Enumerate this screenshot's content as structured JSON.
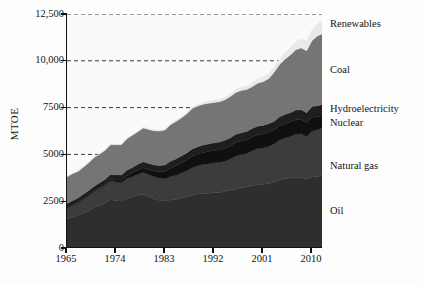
{
  "chart_data": {
    "type": "area",
    "stacked": true,
    "title": "",
    "subtitle": "",
    "xlabel": "",
    "ylabel": "MTOE",
    "xlim": [
      1965,
      2012
    ],
    "ylim": [
      0,
      12500
    ],
    "grid": true,
    "grid_style": "dashed-horizontal",
    "legend_position": "right-outside-series-labels",
    "ytick_labels": [
      "12,500",
      "10,000",
      "7500",
      "5000",
      "2500",
      "0"
    ],
    "ytick_values": [
      12500,
      10000,
      7500,
      5000,
      2500,
      0
    ],
    "xtick_labels": [
      "1965",
      "1974",
      "1983",
      "1992",
      "2001",
      "2010"
    ],
    "xtick_values": [
      1965,
      1974,
      1983,
      1992,
      2001,
      2010
    ],
    "x": [
      1965,
      1966,
      1967,
      1968,
      1969,
      1970,
      1971,
      1972,
      1973,
      1974,
      1975,
      1976,
      1977,
      1978,
      1979,
      1980,
      1981,
      1982,
      1983,
      1984,
      1985,
      1986,
      1987,
      1988,
      1989,
      1990,
      1991,
      1992,
      1993,
      1994,
      1995,
      1996,
      1997,
      1998,
      1999,
      2000,
      2001,
      2002,
      2003,
      2004,
      2005,
      2006,
      2007,
      2008,
      2009,
      2010,
      2011,
      2012
    ],
    "series": [
      {
        "name": "Oil",
        "color": "#2e2e2e",
        "values": [
          1530,
          1640,
          1740,
          1870,
          2000,
          2160,
          2270,
          2400,
          2580,
          2540,
          2500,
          2660,
          2740,
          2830,
          2870,
          2740,
          2620,
          2540,
          2510,
          2560,
          2580,
          2680,
          2740,
          2830,
          2880,
          2920,
          2930,
          2970,
          2970,
          3030,
          3080,
          3150,
          3230,
          3260,
          3340,
          3380,
          3400,
          3430,
          3510,
          3650,
          3700,
          3740,
          3780,
          3760,
          3680,
          3790,
          3820,
          3880
        ]
      },
      {
        "name": "Natural gas",
        "color": "#3c3c3c",
        "values": [
          620,
          660,
          700,
          750,
          810,
          870,
          920,
          960,
          1000,
          1000,
          990,
          1050,
          1070,
          1110,
          1170,
          1180,
          1180,
          1190,
          1190,
          1260,
          1300,
          1320,
          1390,
          1460,
          1510,
          1540,
          1570,
          1580,
          1600,
          1610,
          1680,
          1760,
          1770,
          1790,
          1850,
          1920,
          1940,
          1990,
          2050,
          2110,
          2170,
          2220,
          2300,
          2340,
          2270,
          2450,
          2500,
          2550
        ]
      },
      {
        "name": "Nuclear",
        "color": "#101010",
        "values": [
          10,
          12,
          16,
          20,
          25,
          30,
          45,
          60,
          75,
          95,
          125,
          155,
          190,
          220,
          245,
          265,
          310,
          340,
          380,
          450,
          510,
          540,
          570,
          610,
          630,
          640,
          660,
          670,
          670,
          690,
          700,
          720,
          710,
          720,
          740,
          750,
          750,
          760,
          740,
          760,
          770,
          770,
          770,
          760,
          740,
          750,
          690,
          640
        ]
      },
      {
        "name": "Hydroelectricity",
        "color": "#1e1e1e",
        "values": [
          200,
          210,
          215,
          225,
          235,
          240,
          250,
          255,
          265,
          275,
          285,
          285,
          300,
          315,
          320,
          330,
          330,
          340,
          355,
          365,
          370,
          375,
          380,
          390,
          390,
          400,
          400,
          405,
          420,
          425,
          430,
          440,
          440,
          450,
          455,
          460,
          455,
          460,
          460,
          480,
          490,
          500,
          520,
          530,
          540,
          570,
          590,
          610
        ]
      },
      {
        "name": "Coal",
        "color": "#757575",
        "values": [
          1440,
          1440,
          1420,
          1450,
          1490,
          1540,
          1530,
          1550,
          1590,
          1600,
          1620,
          1680,
          1720,
          1730,
          1800,
          1820,
          1820,
          1840,
          1870,
          1950,
          2000,
          2030,
          2090,
          2160,
          2180,
          2180,
          2170,
          2150,
          2150,
          2160,
          2200,
          2240,
          2260,
          2250,
          2230,
          2290,
          2340,
          2400,
          2610,
          2790,
          2950,
          3080,
          3220,
          3300,
          3310,
          3530,
          3730,
          3780
        ]
      },
      {
        "name": "Renewables",
        "color": "#e9e9e9",
        "values": [
          20,
          22,
          24,
          26,
          28,
          30,
          32,
          34,
          36,
          38,
          40,
          42,
          45,
          48,
          52,
          55,
          58,
          62,
          66,
          70,
          75,
          80,
          85,
          92,
          100,
          108,
          116,
          124,
          134,
          144,
          156,
          168,
          180,
          194,
          210,
          228,
          246,
          268,
          292,
          320,
          352,
          388,
          428,
          472,
          520,
          580,
          650,
          720
        ]
      }
    ],
    "series_labels_right": [
      {
        "name": "Renewables",
        "text": "Renewables"
      },
      {
        "name": "Coal",
        "text": "Coal"
      },
      {
        "name": "Hydroelectricity",
        "text": "Hydroelectricity"
      },
      {
        "name": "Nuclear",
        "text": "Nuclear"
      },
      {
        "name": "Natural gas",
        "text": "Natural gas"
      },
      {
        "name": "Oil",
        "text": "Oil"
      }
    ],
    "colors": {
      "oil": "#2e2e2e",
      "natural_gas": "#3c3c3c",
      "nuclear": "#101010",
      "hydroelectricity": "#1e1e1e",
      "coal": "#757575",
      "renewables": "#e9e9e9",
      "axis": "#111111",
      "gridline": "#3a3a3a",
      "background": "#ffffff"
    }
  },
  "axes": {
    "y_title": "MTOE"
  }
}
